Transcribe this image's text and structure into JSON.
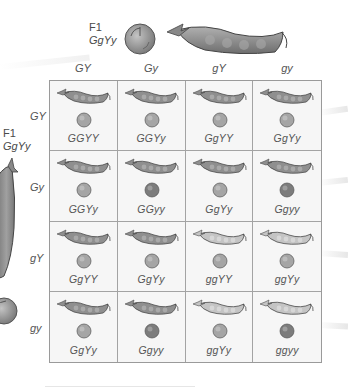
{
  "top_parent": {
    "generation": "F1",
    "genotype": "GgYy",
    "pea_color": "#9a9a9a",
    "pod_color": "#8e8e8e"
  },
  "side_parent": {
    "generation": "F1",
    "genotype": "GgYy",
    "pea_color": "#9a9a9a",
    "pod_color": "#8e8e8e"
  },
  "column_gametes": [
    "GY",
    "Gy",
    "gY",
    "gy"
  ],
  "row_gametes": [
    "GY",
    "Gy",
    "gY",
    "gy"
  ],
  "colors": {
    "green_pod": "#8f8f8f",
    "yellow_pod": "#c4c4c4",
    "yellow_pea": "#a5a5a5",
    "green_pea": "#7c7c7c",
    "grid_line": "#a3a3a3",
    "cell_bg": "#f6f6f6"
  },
  "grid": [
    [
      {
        "genotype": "GGYY",
        "pod": "green",
        "pea": "yellow"
      },
      {
        "genotype": "GGYy",
        "pod": "green",
        "pea": "yellow"
      },
      {
        "genotype": "GgYY",
        "pod": "green",
        "pea": "yellow"
      },
      {
        "genotype": "GgYy",
        "pod": "green",
        "pea": "yellow"
      }
    ],
    [
      {
        "genotype": "GGYy",
        "pod": "green",
        "pea": "yellow"
      },
      {
        "genotype": "GGyy",
        "pod": "green",
        "pea": "green"
      },
      {
        "genotype": "GgYy",
        "pod": "green",
        "pea": "yellow"
      },
      {
        "genotype": "Ggyy",
        "pod": "green",
        "pea": "green"
      }
    ],
    [
      {
        "genotype": "GgYY",
        "pod": "green",
        "pea": "yellow"
      },
      {
        "genotype": "GgYy",
        "pod": "green",
        "pea": "yellow"
      },
      {
        "genotype": "ggYY",
        "pod": "yellow",
        "pea": "yellow"
      },
      {
        "genotype": "ggYy",
        "pod": "yellow",
        "pea": "yellow"
      }
    ],
    [
      {
        "genotype": "GgYy",
        "pod": "green",
        "pea": "yellow"
      },
      {
        "genotype": "Ggyy",
        "pod": "green",
        "pea": "green"
      },
      {
        "genotype": "ggYy",
        "pod": "yellow",
        "pea": "yellow"
      },
      {
        "genotype": "ggyy",
        "pod": "yellow",
        "pea": "green"
      }
    ]
  ]
}
